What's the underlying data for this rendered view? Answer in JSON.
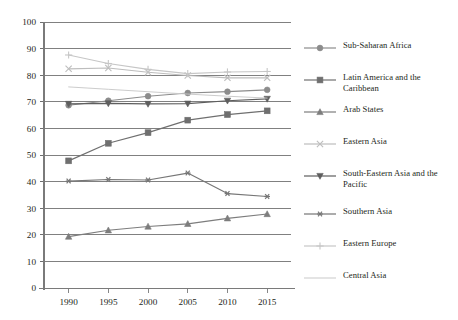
{
  "chart_data": {
    "type": "line",
    "title": "",
    "subtitle": "",
    "xlabel": "",
    "ylabel": "",
    "x": [
      1990,
      1995,
      2000,
      2005,
      2010,
      2015
    ],
    "xtick_labels": [
      "1990",
      "1995",
      "2000",
      "2005",
      "2010",
      "2015"
    ],
    "ytick_labels": [
      "0",
      "10",
      "20",
      "30",
      "40",
      "50",
      "60",
      "70",
      "80",
      "90",
      "100"
    ],
    "ylim": [
      0,
      100
    ],
    "ytick_step": 10,
    "grid": "horizontal",
    "legend_position": "right",
    "series": [
      {
        "name": "Sub-Saharan Africa",
        "marker": "circle",
        "color": "#8c8c8c",
        "values": [
          68.7,
          70.4,
          72.1,
          73.3,
          73.8,
          74.5
        ]
      },
      {
        "name": "Latin America and the Caribbean",
        "marker": "square",
        "color": "#6f6f6f",
        "values": [
          47.8,
          54.4,
          58.4,
          63.1,
          65.2,
          66.6
        ]
      },
      {
        "name": "Arab States",
        "marker": "triangle-up",
        "color": "#7d7d7d",
        "values": [
          19.3,
          21.7,
          23.1,
          24.1,
          26.2,
          27.8
        ]
      },
      {
        "name": "Eastern Asia",
        "marker": "x",
        "color": "#bdbdbd",
        "values": [
          82.4,
          82.7,
          81.1,
          79.9,
          79.0,
          79.0
        ]
      },
      {
        "name": "South-Eastern Asia and the Pacific",
        "marker": "triangle-down",
        "color": "#5e5e5e",
        "values": [
          69.2,
          69.4,
          69.2,
          69.3,
          70.4,
          71.1
        ]
      },
      {
        "name": "Southern Asia",
        "marker": "asterisk",
        "color": "#767676",
        "values": [
          40.2,
          40.8,
          40.6,
          43.2,
          35.5,
          34.4
        ]
      },
      {
        "name": "Eastern Europe",
        "marker": "plus",
        "color": "#c6c6c6",
        "values": [
          87.6,
          84.4,
          82.2,
          80.6,
          81.2,
          81.4
        ]
      },
      {
        "name": "Central Asia",
        "marker": "none",
        "color": "#c9c9c9",
        "values": [
          75.6,
          74.7,
          73.8,
          72.9,
          72.1,
          71.4
        ]
      }
    ]
  },
  "axes": {
    "y_axis_name": "value-axis",
    "x_axis_name": "year-axis"
  }
}
